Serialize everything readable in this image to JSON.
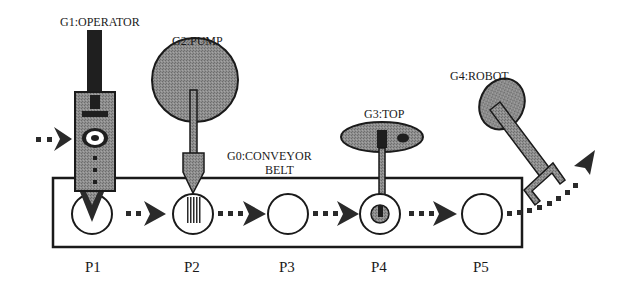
{
  "diagram": {
    "type": "conveyor-workcell-schematic",
    "colors": {
      "ink": "#1a1a1a",
      "fill_gray": "#8a8a8a",
      "fill_dark": "#222222",
      "background": "#ffffff"
    },
    "conveyor": {
      "label_line1": "G0:CONVEYOR",
      "label_line2": "BELT"
    },
    "devices": [
      {
        "id": "G1",
        "label": "G1:OPERATOR",
        "position": "P1"
      },
      {
        "id": "G2",
        "label": "G2:PUMP",
        "position": "P2"
      },
      {
        "id": "G3",
        "label": "G3:TOP",
        "position": "P4"
      },
      {
        "id": "G4",
        "label": "G4:ROBOT",
        "position": "P5"
      }
    ],
    "positions": [
      {
        "label": "P1"
      },
      {
        "label": "P2"
      },
      {
        "label": "P3"
      },
      {
        "label": "P4"
      },
      {
        "label": "P5"
      }
    ]
  }
}
